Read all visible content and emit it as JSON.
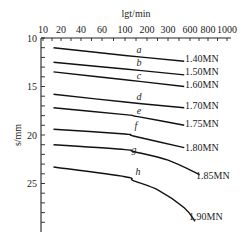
{
  "chart_data": {
    "type": "line",
    "title": "",
    "xlabel": "lgt/min",
    "ylabel": "s/mm",
    "x_axis_position": "top",
    "x_scale": "log",
    "x_tick_labels": [
      "10",
      "20",
      "40",
      "60",
      "100",
      "200",
      "300",
      "600",
      "800",
      "1000"
    ],
    "y_tick_labels": [
      "10",
      "15",
      "20",
      "25"
    ],
    "ylim": [
      10,
      29.5
    ],
    "y_inverted": true,
    "grid": false,
    "legend": "inline labels at curve ends",
    "series": [
      {
        "name": "a",
        "label": "1.40MN",
        "points": [
          [
            15,
            11.0
          ],
          [
            100,
            11.8
          ],
          [
            500,
            12.4
          ]
        ]
      },
      {
        "name": "b",
        "label": "1.50MN",
        "points": [
          [
            15,
            12.5
          ],
          [
            100,
            13.2
          ],
          [
            500,
            13.8
          ]
        ]
      },
      {
        "name": "c",
        "label": "1.60MN",
        "points": [
          [
            15,
            13.5
          ],
          [
            100,
            14.3
          ],
          [
            500,
            15.0
          ]
        ]
      },
      {
        "name": "d",
        "label": "1.70MN",
        "points": [
          [
            15,
            15.8
          ],
          [
            100,
            16.6
          ],
          [
            500,
            17.2
          ]
        ]
      },
      {
        "name": "e",
        "label": "1.75MN",
        "points": [
          [
            15,
            17.2
          ],
          [
            100,
            17.9
          ],
          [
            150,
            18.1
          ],
          [
            500,
            19.0
          ]
        ]
      },
      {
        "name": "f",
        "label": "1.80MN",
        "points": [
          [
            15,
            19.4
          ],
          [
            100,
            19.9
          ],
          [
            130,
            20.1
          ],
          [
            500,
            21.3
          ]
        ]
      },
      {
        "name": "g",
        "label": "1.85MN",
        "points": [
          [
            15,
            21.0
          ],
          [
            100,
            21.5
          ],
          [
            130,
            21.7
          ],
          [
            300,
            22.6
          ],
          [
            700,
            24.1
          ]
        ]
      },
      {
        "name": "h",
        "label": "1.90MN",
        "points": [
          [
            15,
            23.3
          ],
          [
            100,
            24.3
          ],
          [
            130,
            24.7
          ],
          [
            250,
            25.7
          ],
          [
            500,
            27.5
          ],
          [
            650,
            28.9
          ]
        ]
      }
    ]
  },
  "labels": {
    "xlabel": "lgt/min",
    "ylabel": "s/mm"
  }
}
